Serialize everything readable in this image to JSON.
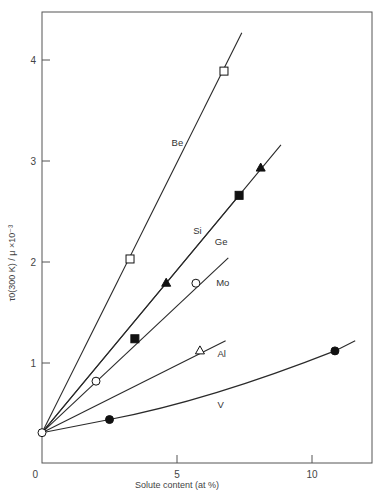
{
  "chart_data": {
    "type": "line",
    "title": "",
    "xlabel": "Solute content (at %)",
    "ylabel": "τ0(300 K) / μ ×10⁻³",
    "xlim": [
      0,
      12.2
    ],
    "ylim": [
      0,
      4.5
    ],
    "xticks": [
      0,
      5,
      10
    ],
    "yticks": [
      0,
      1,
      2,
      3,
      4
    ],
    "grid": false,
    "legend": "inline labels",
    "origin_point": {
      "x": 0,
      "y": 0.31,
      "marker": "open-circle"
    },
    "series": [
      {
        "name": "Be",
        "marker": "open-square",
        "label_pos": {
          "x": 4.8,
          "y": 3.15
        },
        "line": [
          {
            "x": 0,
            "y": 0.31
          },
          {
            "x": 7.4,
            "y": 4.27
          }
        ],
        "points": [
          {
            "x": 3.26,
            "y": 2.03
          },
          {
            "x": 6.74,
            "y": 3.89
          }
        ]
      },
      {
        "name": "Si",
        "marker": "filled-triangle",
        "label_pos": {
          "x": 5.6,
          "y": 2.28
        },
        "line": [
          {
            "x": 0,
            "y": 0.31
          },
          {
            "x": 7.3,
            "y": 2.66
          },
          {
            "x": 8.85,
            "y": 3.16
          }
        ],
        "points": [
          {
            "x": 4.6,
            "y": 1.79
          },
          {
            "x": 8.1,
            "y": 2.93
          }
        ]
      },
      {
        "name": "Ge",
        "marker": "filled-square",
        "label_pos": {
          "x": 6.4,
          "y": 2.17
        },
        "line": [
          {
            "x": 0,
            "y": 0.31
          },
          {
            "x": 7.3,
            "y": 2.66
          }
        ],
        "points": [
          {
            "x": 3.44,
            "y": 1.24
          },
          {
            "x": 7.3,
            "y": 2.66
          }
        ]
      },
      {
        "name": "Mo",
        "marker": "open-circle",
        "label_pos": {
          "x": 6.45,
          "y": 1.76
        },
        "line": [
          {
            "x": 0,
            "y": 0.31
          },
          {
            "x": 6.9,
            "y": 2.04
          }
        ],
        "points": [
          {
            "x": 2.0,
            "y": 0.82
          },
          {
            "x": 5.7,
            "y": 1.79
          }
        ]
      },
      {
        "name": "Al",
        "marker": "open-triangle",
        "label_pos": {
          "x": 6.5,
          "y": 1.06
        },
        "line": [
          {
            "x": 0,
            "y": 0.31
          },
          {
            "x": 6.8,
            "y": 1.22
          }
        ],
        "points": [
          {
            "x": 5.85,
            "y": 1.12
          }
        ]
      },
      {
        "name": "V",
        "marker": "filled-circle",
        "label_pos": {
          "x": 6.5,
          "y": 0.55
        },
        "line": [
          {
            "x": 0,
            "y": 0.31
          },
          {
            "x": 2.5,
            "y": 0.44
          },
          {
            "x": 6.0,
            "y": 0.7
          },
          {
            "x": 10.85,
            "y": 1.12
          },
          {
            "x": 11.6,
            "y": 1.22
          }
        ],
        "points": [
          {
            "x": 2.5,
            "y": 0.44
          },
          {
            "x": 10.85,
            "y": 1.12
          }
        ]
      }
    ]
  }
}
